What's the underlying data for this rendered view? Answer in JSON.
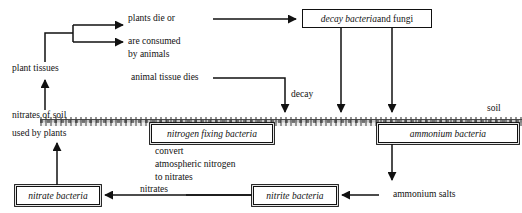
{
  "diagram": {
    "soil_label": "soil",
    "labels": {
      "plant_tissues": "plant tissues",
      "plants_die_1": "plants die or",
      "plants_die_2": "are consumed",
      "plants_die_3": "by animals",
      "animal_tissue_dies": "animal tissue dies",
      "decay": "decay",
      "nitrates_of_soil": "nitrates of soil",
      "used_by_plants": "used by plants",
      "convert": "convert",
      "atmospheric_nitrogen": "atmospheric nitrogen",
      "to_nitrates": "to nitrates",
      "nitrates": "nitrates",
      "ammonium_salts": "ammonium salts"
    },
    "boxes": {
      "decay_bacteria_italic": "decay bacteria",
      "decay_bacteria_roman": " and fungi",
      "nitrogen_fixing_bacteria": "nitrogen fixing bacteria",
      "ammonium_bacteria": "ammonium bacteria",
      "nitrate_bacteria": "nitrate bacteria",
      "nitrite_bacteria": "nitrite bacteria"
    },
    "colors": {
      "ink": "#111111",
      "background": "#ffffff",
      "soil_line": "#3c3c3c"
    }
  }
}
